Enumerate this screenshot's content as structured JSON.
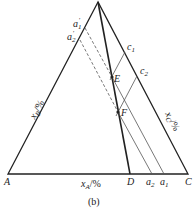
{
  "figure": {
    "caption": "(b)",
    "vertices": {
      "A": "A",
      "C": "C",
      "D": "D"
    },
    "points": {
      "E": "E",
      "F": "F",
      "a1": "a",
      "a1_sub": "1",
      "a2": "a",
      "a2_sub": "2",
      "a1p": "a",
      "a1p_sub": "1",
      "a1p_sup": "′",
      "a2p": "a",
      "a2p_sub": "2",
      "a2p_sup": "′",
      "c1": "c",
      "c1_sub": "1",
      "c2": "c",
      "c2_sub": "2"
    },
    "axes": {
      "xA_main": "x",
      "xA_sub": "A",
      "xA_unit": "/%",
      "xB_main": "x",
      "xB_sub": "B",
      "xB_unit": "/%",
      "xC_main": "x",
      "xC_sub": "C",
      "xC_unit": "/%"
    },
    "colors": {
      "line": "#222222",
      "thin_line": "#555555"
    }
  }
}
